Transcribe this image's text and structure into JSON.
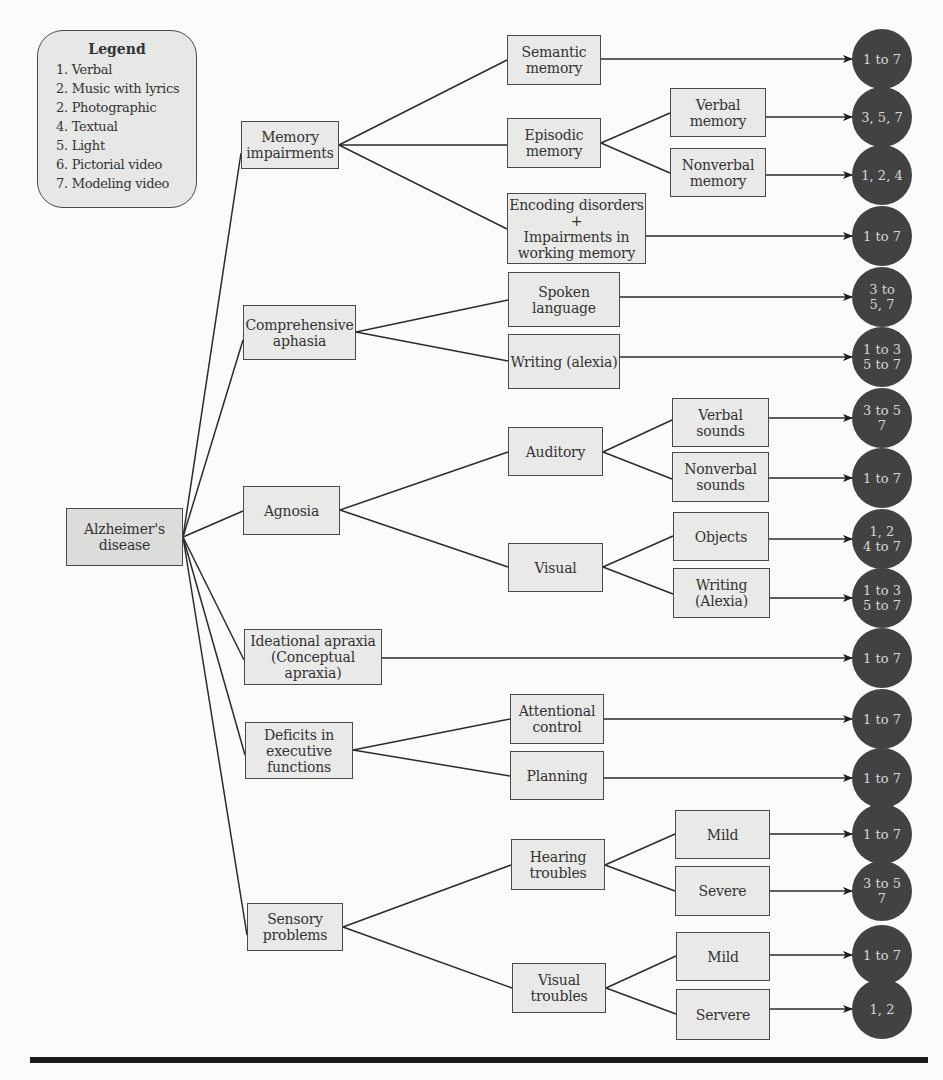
{
  "colors": {
    "background": "#fbfbfa",
    "box_fill": "#e9e9e7",
    "box_border": "#4a4a4a",
    "outcome_fill": "#424242",
    "outcome_text": "#d6d6d6",
    "rule": "#1c1c1c"
  },
  "legend": {
    "title": "Legend",
    "items": [
      "1. Verbal",
      "2. Music with lyrics",
      "2. Photographic",
      "4. Textual",
      "5. Light",
      "6. Pictorial video",
      "7. Modeling video"
    ]
  },
  "root": {
    "label": "Alzheimer's\ndisease"
  },
  "level1": [
    {
      "id": "memory",
      "label": "Memory\nimpairments"
    },
    {
      "id": "aphasia",
      "label": "Comprehensive\naphasia"
    },
    {
      "id": "agnosia",
      "label": "Agnosia"
    },
    {
      "id": "apraxia",
      "label": "Ideational apraxia\n(Conceptual apraxia)"
    },
    {
      "id": "executive",
      "label": "Deficits in\nexecutive\nfunctions"
    },
    {
      "id": "sensory",
      "label": "Sensory\nproblems"
    }
  ],
  "level2": [
    {
      "id": "semantic",
      "parent": "memory",
      "label": "Semantic\nmemory"
    },
    {
      "id": "episodic",
      "parent": "memory",
      "label": "Episodic\nmemory"
    },
    {
      "id": "encoding",
      "parent": "memory",
      "label": "Encoding disorders\n+\nImpairments in\nworking memory"
    },
    {
      "id": "spoken",
      "parent": "aphasia",
      "label": "Spoken\nlanguage"
    },
    {
      "id": "writing_aphasia",
      "parent": "aphasia",
      "label": "Writing (alexia)"
    },
    {
      "id": "auditory",
      "parent": "agnosia",
      "label": "Auditory"
    },
    {
      "id": "visual",
      "parent": "agnosia",
      "label": "Visual"
    },
    {
      "id": "attentional",
      "parent": "executive",
      "label": "Attentional\ncontrol"
    },
    {
      "id": "planning",
      "parent": "executive",
      "label": "Planning"
    },
    {
      "id": "hearing",
      "parent": "sensory",
      "label": "Hearing\ntroubles"
    },
    {
      "id": "visual_troubles",
      "parent": "sensory",
      "label": "Visual\ntroubles"
    }
  ],
  "level3": [
    {
      "id": "verbal_memory",
      "parent": "episodic",
      "label": "Verbal\nmemory"
    },
    {
      "id": "nonverbal_memory",
      "parent": "episodic",
      "label": "Nonverbal\nmemory"
    },
    {
      "id": "verbal_sounds",
      "parent": "auditory",
      "label": "Verbal\nsounds"
    },
    {
      "id": "nonverbal_sounds",
      "parent": "auditory",
      "label": "Nonverbal\nsounds"
    },
    {
      "id": "objects",
      "parent": "visual",
      "label": "Objects"
    },
    {
      "id": "writing_visual",
      "parent": "visual",
      "label": "Writing\n(Alexia)"
    },
    {
      "id": "hearing_mild",
      "parent": "hearing",
      "label": "Mild"
    },
    {
      "id": "hearing_severe",
      "parent": "hearing",
      "label": "Severe"
    },
    {
      "id": "visual_mild",
      "parent": "visual_troubles",
      "label": "Mild"
    },
    {
      "id": "visual_servere",
      "parent": "visual_troubles",
      "label": "Servere"
    }
  ],
  "outcomes": [
    {
      "from": "semantic",
      "label": "1 to 7"
    },
    {
      "from": "verbal_memory",
      "label": "3, 5, 7"
    },
    {
      "from": "nonverbal_memory",
      "label": "1, 2, 4"
    },
    {
      "from": "encoding",
      "label": "1 to 7"
    },
    {
      "from": "spoken",
      "label": "3 to\n5, 7"
    },
    {
      "from": "writing_aphasia",
      "label": "1 to 3\n5 to 7"
    },
    {
      "from": "verbal_sounds",
      "label": "3 to 5\n7"
    },
    {
      "from": "nonverbal_sounds",
      "label": "1 to 7"
    },
    {
      "from": "objects",
      "label": "1, 2\n4 to 7"
    },
    {
      "from": "writing_visual",
      "label": "1 to 3\n5 to 7"
    },
    {
      "from": "apraxia",
      "label": "1 to 7"
    },
    {
      "from": "attentional",
      "label": "1 to 7"
    },
    {
      "from": "planning",
      "label": "1 to 7"
    },
    {
      "from": "hearing_mild",
      "label": "1 to 7"
    },
    {
      "from": "hearing_severe",
      "label": "3 to 5\n7"
    },
    {
      "from": "visual_mild",
      "label": "1 to 7"
    },
    {
      "from": "visual_servere",
      "label": "1, 2"
    }
  ]
}
